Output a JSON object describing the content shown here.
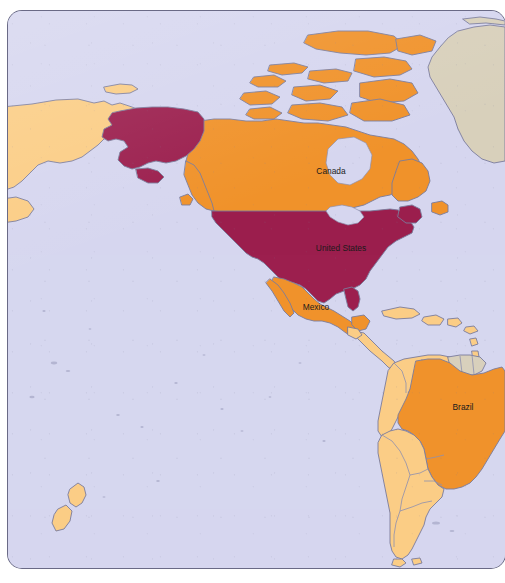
{
  "map": {
    "type": "choropleth-world-map",
    "projection": "equirectangular-americas-centered",
    "frame": {
      "shape": "rounded-rectangle",
      "corner_radius_px": 14,
      "border_color": "#6a6a86"
    },
    "colors": {
      "ocean": "#d6d7ef",
      "highlight_dark": "#9c1f4e",
      "highlight_mid": "#f0922b",
      "highlight_light": "#fbcd86",
      "neutral_land": "#d8d0bc",
      "coastline": "#7b7c9c",
      "internal_border": "#8e8fae",
      "label_text": "#1b1b1b",
      "page_background": "#ffffff"
    },
    "legend_tiers": [
      {
        "name": "tier-dark",
        "color": "#9c1f4e",
        "countries": [
          "United States"
        ]
      },
      {
        "name": "tier-mid",
        "color": "#f0922b",
        "countries": [
          "Canada",
          "Mexico",
          "Brazil"
        ]
      },
      {
        "name": "tier-light",
        "color": "#fbcd86",
        "countries": [
          "Russia",
          "Colombia",
          "Venezuela",
          "Peru",
          "Bolivia",
          "Chile",
          "Argentina",
          "Paraguay",
          "Uruguay",
          "Ecuador",
          "Guatemala",
          "Honduras",
          "Nicaragua",
          "Costa Rica",
          "Panama",
          "Belize",
          "Cuba",
          "Hispaniola",
          "New Zealand"
        ]
      },
      {
        "name": "tier-neutral",
        "color": "#d8d0bc",
        "countries": [
          "Greenland",
          "Guyana",
          "Suriname",
          "French Guiana"
        ]
      }
    ],
    "labels": [
      {
        "id": "canada",
        "text": "Canada",
        "x": 323,
        "y": 161
      },
      {
        "id": "united-states",
        "text": "United States",
        "x": 333,
        "y": 238
      },
      {
        "id": "mexico",
        "text": "Mexico",
        "x": 308,
        "y": 297
      },
      {
        "id": "brazil",
        "text": "Brazil",
        "x": 455,
        "y": 397
      }
    ]
  }
}
